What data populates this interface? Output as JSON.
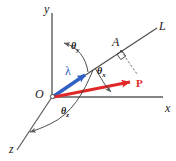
{
  "figure": {
    "width": 176,
    "height": 161,
    "background_color": "#ffffff",
    "axes": [
      {
        "id": "y",
        "label": "y",
        "direction": "vertical-up"
      },
      {
        "id": "x",
        "label": "x",
        "direction": "horizontal-right"
      },
      {
        "id": "z",
        "label": "z",
        "direction": "diagonal-down-left"
      }
    ],
    "points": [
      {
        "id": "origin",
        "label": "O"
      },
      {
        "id": "a",
        "label": "A"
      }
    ],
    "lines": [
      {
        "id": "line-l",
        "label": "L"
      }
    ],
    "vectors": [
      {
        "id": "lambda",
        "label": "λ",
        "color": "#2f5fc4",
        "description": "blue unit vector along line L"
      },
      {
        "id": "p",
        "label": "P",
        "color": "#e02828",
        "description": "red force vector P"
      }
    ],
    "angles": [
      {
        "id": "theta-y",
        "symbol": "θ",
        "subscript": "y",
        "measured_from": "y"
      },
      {
        "id": "theta-x",
        "symbol": "θ",
        "subscript": "x",
        "measured_from": "x"
      },
      {
        "id": "theta-z",
        "symbol": "θ",
        "subscript": "z",
        "measured_from": "z"
      }
    ],
    "markers": [
      {
        "id": "right-angle-at-a",
        "label": "right-angle-marker"
      }
    ],
    "colors": {
      "axis": "#5b5b5b",
      "line": "#4a4a4a",
      "lambda": "#2f5fc4",
      "force": "#e02828",
      "text": "#1a1a1a"
    }
  }
}
